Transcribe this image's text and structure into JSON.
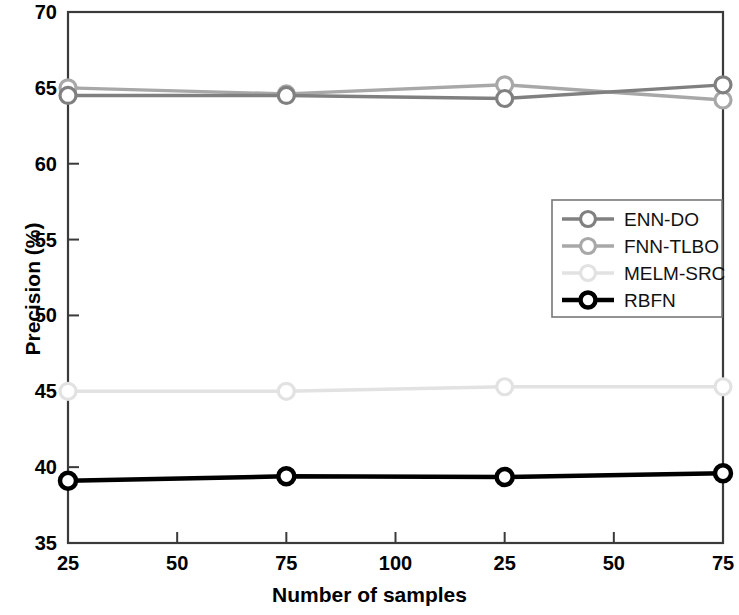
{
  "chart_data": {
    "type": "line",
    "title": "",
    "xlabel": "Number of samples",
    "ylabel": "Precision (%)",
    "x": [
      25,
      75,
      25,
      75
    ],
    "x_positions": [
      0,
      2,
      4,
      6
    ],
    "xticks": [
      "25",
      "50",
      "75",
      "100",
      "25",
      "50",
      "75"
    ],
    "xtick_positions": [
      0,
      1,
      2,
      3,
      4,
      5,
      6
    ],
    "yticks": [
      "35",
      "40",
      "45",
      "50",
      "55",
      "60",
      "65",
      "70"
    ],
    "ylim": [
      35,
      70
    ],
    "xlim": [
      0,
      6
    ],
    "grid": false,
    "legend_position": "center-right",
    "series": [
      {
        "name": "ENN-DO",
        "color": "#808080",
        "marker": "circle",
        "values": [
          64.5,
          64.5,
          64.3,
          65.2
        ]
      },
      {
        "name": "FNN-TLBO",
        "color": "#a8a8a8",
        "marker": "circle",
        "values": [
          65.0,
          64.6,
          65.2,
          64.2
        ]
      },
      {
        "name": "MELM-SRC",
        "color": "#e2e2e2",
        "marker": "circle",
        "values": [
          45.0,
          45.0,
          45.3,
          45.3
        ]
      },
      {
        "name": "RBFN",
        "color": "#000000",
        "marker": "circle",
        "values": [
          39.1,
          39.4,
          39.35,
          39.6
        ]
      }
    ]
  },
  "legend": {
    "items": [
      {
        "label": "ENN-DO"
      },
      {
        "label": "FNN-TLBO"
      },
      {
        "label": "MELM-SRC"
      },
      {
        "label": "RBFN"
      }
    ]
  },
  "axes": {
    "x_title": "Number of samples",
    "y_title": "Precision (%)"
  }
}
